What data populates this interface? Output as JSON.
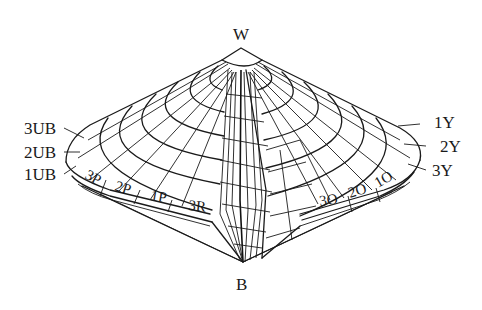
{
  "diagram": {
    "type": "color-solid",
    "apex_labels": {
      "top": "W",
      "bottom": "B"
    },
    "left_side_labels": [
      "3UB",
      "2UB",
      "1UB"
    ],
    "right_side_labels": [
      "1Y",
      "2Y",
      "3Y"
    ],
    "rim_labels_left": [
      "3P",
      "2P",
      "1P",
      "3R"
    ],
    "rim_labels_right": [
      "3O",
      "2O",
      "1O"
    ],
    "line_color": "#1a1a1a",
    "background": "#ffffff"
  }
}
